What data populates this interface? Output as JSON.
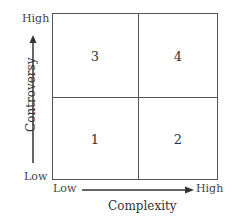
{
  "diagram": {
    "type": "2x2 matrix",
    "x_axis": {
      "title": "Complexity",
      "low_label": "Low",
      "high_label": "High"
    },
    "y_axis": {
      "title": "Controversy",
      "low_label": "Low",
      "high_label": "High"
    },
    "quadrants": {
      "top_left": "3",
      "top_right": "4",
      "bottom_left": "1",
      "bottom_right": "2"
    }
  },
  "colors": {
    "line": "#555555",
    "text": "#333333"
  }
}
